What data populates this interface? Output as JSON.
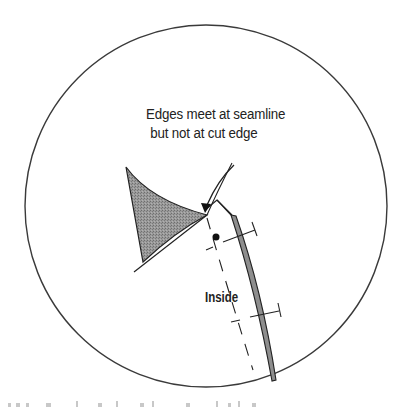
{
  "diagram": {
    "type": "sewing-illustration",
    "callout": {
      "line1": "Edges meet at seamline",
      "line2": "but not at cut edge"
    },
    "labels": {
      "inside": "Inside"
    },
    "elements": {
      "magnifier_circle": "circle outline framing detail",
      "shaded_piece": "gray stippled fabric piece (outside/right side)",
      "facing_strip": "gray narrow fabric strip along right edge",
      "seamline": "dashed line",
      "pin_marks": "perpendicular tick marks with end bars",
      "dot": "matching dot marker",
      "arrow": "curved pointer arrow to seamline meeting point"
    },
    "colors": {
      "line": "#333333",
      "shade": "#8a8a8a",
      "background": "#ffffff"
    },
    "caption_fragment": "(cut-off, illegible text at bottom edge)"
  }
}
